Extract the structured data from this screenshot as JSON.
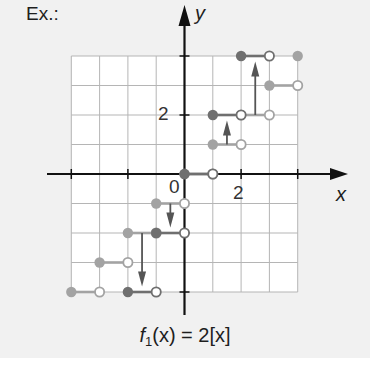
{
  "label": "Ex.:",
  "axes": {
    "x_label": "x",
    "y_label": "y",
    "origin_label": "0"
  },
  "ticks": {
    "x_tick_label": "2",
    "y_tick_label": "2"
  },
  "caption": {
    "func": "f",
    "sub": "1",
    "rest": "(x) = 2[x]"
  },
  "colors": {
    "panel_bg": "#f1f1f1",
    "grid_fill": "#ffffff",
    "grid_line": "#b5b5b5",
    "axis": "#111111",
    "dark_series": "#6f6f6f",
    "light_series": "#a3a3a3",
    "arrow": "#555555"
  },
  "chart_data": {
    "type": "scatter",
    "title": "f1(x) = 2[x]",
    "xlabel": "x",
    "ylabel": "y",
    "xlim": [
      -4,
      4
    ],
    "ylim": [
      -4,
      4
    ],
    "grid": true,
    "tick_labels": {
      "x": [
        "0",
        "2"
      ],
      "y": [
        "2"
      ]
    },
    "series": [
      {
        "name": "f(x) = [x] (light)",
        "style": "step",
        "segments": [
          {
            "x0": -4,
            "x1": -3,
            "y": -4,
            "closed_left": true,
            "open_right": true
          },
          {
            "x0": -3,
            "x1": -2,
            "y": -3,
            "closed_left": true,
            "open_right": true
          },
          {
            "x0": -2,
            "x1": -1,
            "y": -2,
            "closed_left": true,
            "open_right": true
          },
          {
            "x0": -1,
            "x1": 0,
            "y": -1,
            "closed_left": true,
            "open_right": true
          },
          {
            "x0": 0,
            "x1": 1,
            "y": 0,
            "closed_left": true,
            "open_right": true
          },
          {
            "x0": 1,
            "x1": 2,
            "y": 1,
            "closed_left": true,
            "open_right": true
          },
          {
            "x0": 2,
            "x1": 3,
            "y": 2,
            "closed_left": true,
            "open_right": true
          },
          {
            "x0": 3,
            "x1": 4,
            "y": 3,
            "closed_left": true,
            "open_right": true
          },
          {
            "x0": 4,
            "x1": 4,
            "y": 4,
            "closed_left": true,
            "open_right": false
          }
        ]
      },
      {
        "name": "f1(x) = 2[x] (dark)",
        "style": "step",
        "segments": [
          {
            "x0": -2,
            "x1": -1,
            "y": -4,
            "closed_left": true,
            "open_right": true
          },
          {
            "x0": -1,
            "x1": 0,
            "y": -2,
            "closed_left": true,
            "open_right": true
          },
          {
            "x0": 0,
            "x1": 1,
            "y": 0,
            "closed_left": true,
            "open_right": true
          },
          {
            "x0": 1,
            "x1": 2,
            "y": 2,
            "closed_left": true,
            "open_right": true
          },
          {
            "x0": 2,
            "x1": 3,
            "y": 4,
            "closed_left": true,
            "open_right": true
          }
        ]
      }
    ],
    "annotations": [
      {
        "type": "arrow",
        "x": 1.5,
        "from_y": 1,
        "to_y": 2,
        "meaning": "vertical stretch by 2"
      },
      {
        "type": "arrow",
        "x": 2.5,
        "from_y": 2,
        "to_y": 4,
        "meaning": "vertical stretch by 2"
      },
      {
        "type": "arrow",
        "x": -0.5,
        "from_y": -1,
        "to_y": -2,
        "meaning": "vertical stretch by 2"
      },
      {
        "type": "arrow",
        "x": -1.5,
        "from_y": -2,
        "to_y": -4,
        "meaning": "vertical stretch by 2"
      }
    ]
  }
}
